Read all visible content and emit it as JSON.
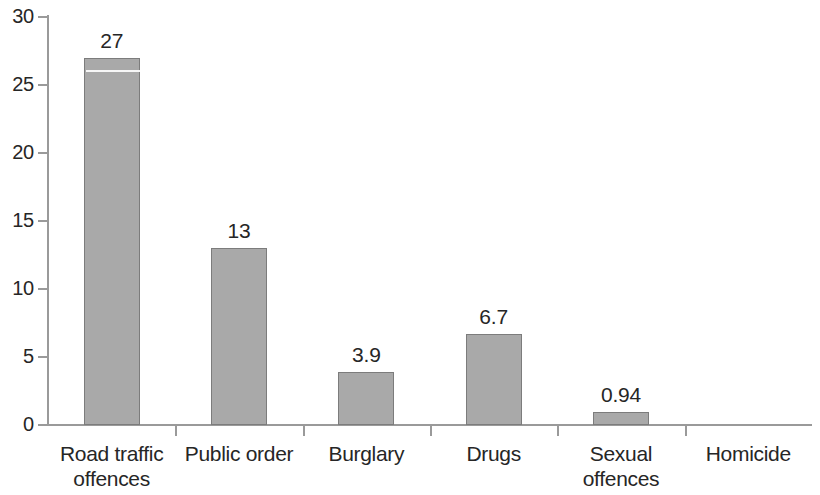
{
  "chart_data": {
    "type": "bar",
    "title": "",
    "subtitle": "",
    "xlabel": "",
    "ylabel": "",
    "categories": [
      "Road traffic offences",
      "Public order",
      "Burglary",
      "Drugs",
      "Sexual offences",
      "Homicide"
    ],
    "category_lines": [
      [
        "Road traffic",
        "offences"
      ],
      [
        "Public order"
      ],
      [
        "Burglary"
      ],
      [
        "Drugs"
      ],
      [
        "Sexual",
        "offences"
      ],
      [
        "Homicide"
      ]
    ],
    "values": [
      27,
      13,
      3.9,
      6.7,
      0.94,
      0
    ],
    "value_labels": [
      "27",
      "13",
      "3.9",
      "6.7",
      "0.94",
      ""
    ],
    "ylim": [
      0,
      30
    ],
    "yticks": [
      0,
      5,
      10,
      15,
      20,
      25,
      30
    ],
    "ytick_labels": [
      "0",
      "5",
      "10",
      "15",
      "20",
      "25",
      "30"
    ],
    "grid": false,
    "legend": false,
    "legend_position": "none",
    "bar_color": "#a9a9a9",
    "bar_border_color": "#7c7c7c",
    "axis_color": "#9a9a9a",
    "text_color": "#262626",
    "background_color": "#ffffff"
  }
}
